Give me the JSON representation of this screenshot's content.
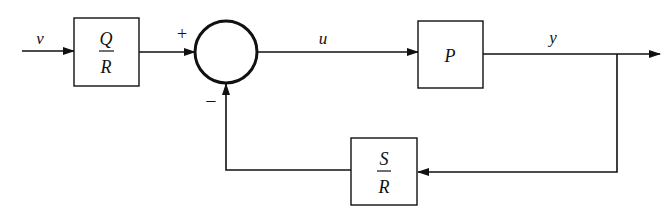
{
  "diagram": {
    "type": "block-diagram",
    "signals": {
      "input": "v",
      "control": "u",
      "output": "y"
    },
    "blocks": {
      "prefilter": {
        "numerator": "Q",
        "denominator": "R"
      },
      "plant": {
        "label": "P"
      },
      "feedback": {
        "numerator": "S",
        "denominator": "R"
      }
    },
    "summing_junction": {
      "plus_sign": "+",
      "minus_sign": "−"
    },
    "colors": {
      "stroke": "#111111",
      "background": "#ffffff"
    }
  }
}
